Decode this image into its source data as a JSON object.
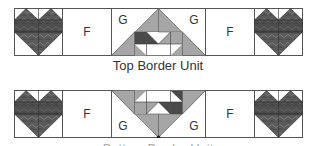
{
  "colors": {
    "outline": "#555555",
    "fabric_dark": "#4a4a4a",
    "fabric_medium": "#a6a6a6",
    "fabric_light": "#ffffff",
    "heart_fabric": "#5a5a5a"
  },
  "top_unit": {
    "caption": "Top Border Unit",
    "blocks": [
      {
        "type": "heart"
      },
      {
        "type": "plain",
        "label": "F"
      },
      {
        "type": "center",
        "left_label": "G",
        "right_label": "G",
        "orientation": "up"
      },
      {
        "type": "plain",
        "label": "F"
      },
      {
        "type": "heart"
      }
    ]
  },
  "bottom_unit": {
    "caption": "Bottom Border Unit",
    "blocks": [
      {
        "type": "heart"
      },
      {
        "type": "plain",
        "label": "F"
      },
      {
        "type": "center",
        "left_label": "G",
        "right_label": "G",
        "orientation": "down"
      },
      {
        "type": "plain",
        "label": "F"
      },
      {
        "type": "heart"
      }
    ]
  }
}
